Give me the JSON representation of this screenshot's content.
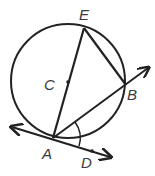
{
  "diagram": {
    "type": "circle-geometry",
    "circle": {
      "center_label": "C",
      "cx": 68,
      "cy": 81,
      "r": 57
    },
    "points": {
      "E": {
        "label": "E",
        "x": 84,
        "y": 28
      },
      "B": {
        "label": "B",
        "x": 126,
        "y": 85
      },
      "C": {
        "label": "C",
        "x": 68,
        "y": 82
      },
      "A": {
        "label": "A",
        "x": 53,
        "y": 138
      },
      "D": {
        "label": "D",
        "x": 92,
        "y": 151
      }
    },
    "segments": [
      "AE (diameter through C)",
      "EB"
    ],
    "rays": [
      "AB extended",
      "AD (tangent) extended both ways"
    ],
    "angle_marked": "BAD",
    "colors": {
      "stroke": "#222222",
      "label": "#3a3a3a"
    }
  }
}
